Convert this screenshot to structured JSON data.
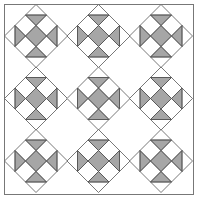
{
  "pattern": {
    "name": "quilt-block-layout",
    "layout": "3x3 on-point blocks",
    "frame": {
      "x": 4.5,
      "y": 4.5,
      "width": 189,
      "height": 190
    },
    "block_centers_x": [
      36,
      98.5,
      161
    ],
    "block_centers_y": [
      36,
      98.5,
      161
    ],
    "block_half_diagonal": 31.5,
    "grid_divisions": 3,
    "cells": {
      "center": "full",
      "top": "inner-half",
      "bottom": "inner-half",
      "left": "inner-half",
      "right": "inner-half",
      "corners": "empty"
    }
  },
  "colors": {
    "background": "#ffffff",
    "fill": "#a6a6a6",
    "line": "#555555",
    "frame": "#777777"
  }
}
